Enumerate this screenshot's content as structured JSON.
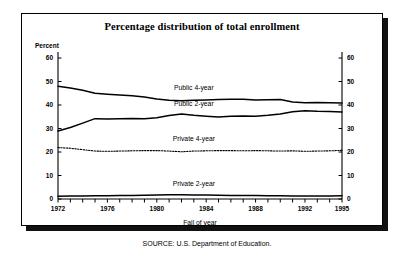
{
  "figure": {
    "title": "Percentage distribution of total enrollment",
    "y_unit_label": "Percent",
    "x_axis_title": "Fall of year",
    "source": "SOURCE: U.S. Department of Education."
  },
  "colors": {
    "line": "#000000",
    "frame": "#000000",
    "shadow": "#111111",
    "background": "#ffffff"
  },
  "chart_data": {
    "type": "line",
    "title": "Percentage distribution of total enrollment",
    "xlabel": "Fall of year",
    "ylabel": "Percent",
    "xlim": [
      1972,
      1995
    ],
    "ylim": [
      0,
      60
    ],
    "grid": false,
    "legend": "inline-labels",
    "y_ticks": [
      0,
      10,
      20,
      30,
      40,
      50,
      60
    ],
    "y_tick_labels": [
      "0",
      "10",
      "20",
      "30",
      "40",
      "50",
      "60"
    ],
    "y_axis_right_ticks": [
      0,
      10,
      20,
      30,
      40,
      50,
      60
    ],
    "y_axis_right_tick_labels": [
      "0",
      "10",
      "20",
      "30",
      "40",
      "50",
      "60"
    ],
    "x_ticks": [
      1972,
      1973,
      1974,
      1975,
      1976,
      1977,
      1978,
      1979,
      1980,
      1981,
      1982,
      1983,
      1984,
      1985,
      1986,
      1987,
      1988,
      1989,
      1990,
      1991,
      1992,
      1993,
      1994,
      1995
    ],
    "x_tick_labels_shown": [
      "1972",
      "1976",
      "1980",
      "1984",
      "1988",
      "1992",
      "1995"
    ],
    "x": [
      1972,
      1973,
      1974,
      1975,
      1976,
      1977,
      1978,
      1979,
      1980,
      1981,
      1982,
      1983,
      1984,
      1985,
      1986,
      1987,
      1988,
      1989,
      1990,
      1991,
      1992,
      1993,
      1994,
      1995
    ],
    "series": [
      {
        "name": "Public 4-year",
        "style": "solid",
        "label_x": 1983,
        "label_y": 46.5,
        "values": [
          48.0,
          47.2,
          46.3,
          45.0,
          44.6,
          44.3,
          43.9,
          43.4,
          42.6,
          42.0,
          41.8,
          42.0,
          42.1,
          42.3,
          42.4,
          42.4,
          42.1,
          42.2,
          42.3,
          41.3,
          41.0,
          41.1,
          41.0,
          40.8
        ]
      },
      {
        "name": "Public 2-year",
        "style": "solid",
        "label_x": 1983,
        "label_y": 39.7,
        "values": [
          28.9,
          30.4,
          32.3,
          34.2,
          34.0,
          34.1,
          34.3,
          34.2,
          34.6,
          35.5,
          36.2,
          35.6,
          35.2,
          34.9,
          35.2,
          35.3,
          35.2,
          35.6,
          36.2,
          37.1,
          37.6,
          37.3,
          37.2,
          37.0
        ]
      },
      {
        "name": "Private 4-year",
        "style": "dotted",
        "label_x": 1983,
        "label_y": 24.5,
        "values": [
          21.9,
          21.6,
          21.0,
          20.4,
          20.3,
          20.4,
          20.5,
          20.6,
          20.6,
          20.4,
          20.1,
          20.4,
          20.5,
          20.6,
          20.6,
          20.5,
          20.6,
          20.5,
          20.4,
          20.5,
          20.3,
          20.4,
          20.5,
          20.7
        ]
      },
      {
        "name": "Private 2-year",
        "style": "solid",
        "label_x": 1983,
        "label_y": 5.5,
        "values": [
          1.2,
          1.3,
          1.3,
          1.4,
          1.4,
          1.5,
          1.5,
          1.6,
          1.7,
          1.8,
          1.8,
          1.7,
          1.7,
          1.6,
          1.5,
          1.5,
          1.5,
          1.4,
          1.4,
          1.3,
          1.3,
          1.3,
          1.3,
          1.4
        ]
      }
    ]
  }
}
